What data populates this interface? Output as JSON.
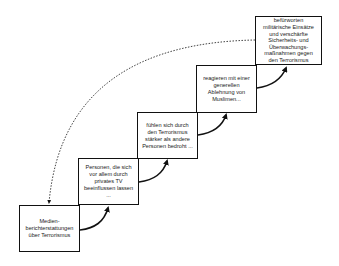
{
  "diagram": {
    "steps": [
      {
        "id": "step-1",
        "lines": [
          "Medien-",
          "berichterstattungen",
          "über Terrorismus"
        ]
      },
      {
        "id": "step-2",
        "lines": [
          "Personen, die sich",
          "vor allem durch",
          "privates TV",
          "beeinflussen lassen",
          "..."
        ]
      },
      {
        "id": "step-3",
        "lines": [
          "fühlen sich durch",
          "den Terrorismus",
          "stärker als andere",
          "Personen bedroht ..."
        ]
      },
      {
        "id": "step-4",
        "lines": [
          "reagieren mit einer",
          "generellen",
          "Ablehnung von",
          "Muslimen..."
        ]
      },
      {
        "id": "step-5",
        "lines": [
          "befürworten",
          "militärische Einsätze",
          "und verschärfte",
          "Sicherheits- und",
          "Überwachungs-",
          "maßnahmen gegen",
          "den Terrorismus"
        ]
      }
    ],
    "connections": [
      {
        "from": "step-1",
        "to": "step-2",
        "style": "solid-curved-arrow"
      },
      {
        "from": "step-2",
        "to": "step-3",
        "style": "solid-curved-arrow"
      },
      {
        "from": "step-3",
        "to": "step-4",
        "style": "solid-curved-arrow"
      },
      {
        "from": "step-4",
        "to": "step-5",
        "style": "solid-curved-arrow"
      },
      {
        "from": "step-5",
        "to": "step-1",
        "style": "dotted-curved-arrow"
      }
    ]
  }
}
